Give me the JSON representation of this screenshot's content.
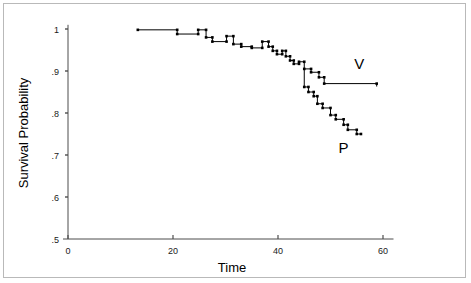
{
  "chart_data": {
    "type": "line",
    "subtype": "kaplan-meier-step",
    "title": "",
    "xlabel": "Time",
    "ylabel": "Survival Probability",
    "xlim": [
      0,
      62
    ],
    "ylim": [
      0.5,
      1.01
    ],
    "xticks": [
      0,
      20,
      40,
      60
    ],
    "xtick_labels": [
      "0",
      "20",
      "40",
      "60"
    ],
    "yticks": [
      0.5,
      0.6,
      0.7,
      0.8,
      0.9,
      1.0
    ],
    "ytick_labels": [
      ".5",
      ".6",
      ".7",
      ".8",
      ".9",
      "1"
    ],
    "grid": false,
    "legend": "inline-annotations",
    "annotations": [
      {
        "text": "V",
        "x": 55.5,
        "y": 0.905
      },
      {
        "text": "P",
        "x": 52.5,
        "y": 0.705
      }
    ],
    "series": [
      {
        "name": "V",
        "label": "V",
        "color": "#000000",
        "marker": "square",
        "points": [
          [
            13.3,
            0.998
          ],
          [
            20.8,
            0.998
          ],
          [
            20.8,
            0.988
          ],
          [
            24.8,
            0.988
          ],
          [
            24.8,
            0.998
          ],
          [
            26.3,
            0.998
          ],
          [
            26.3,
            0.98
          ],
          [
            27.5,
            0.98
          ],
          [
            27.5,
            0.97
          ],
          [
            30.2,
            0.97
          ],
          [
            30.2,
            0.983
          ],
          [
            31.5,
            0.983
          ],
          [
            31.5,
            0.964
          ],
          [
            33.0,
            0.964
          ],
          [
            33.0,
            0.958
          ],
          [
            35.0,
            0.958
          ],
          [
            35.0,
            0.955
          ],
          [
            37.0,
            0.955
          ],
          [
            37.0,
            0.97
          ],
          [
            38.2,
            0.97
          ],
          [
            38.2,
            0.958
          ],
          [
            39.0,
            0.958
          ],
          [
            39.0,
            0.948
          ],
          [
            39.8,
            0.948
          ],
          [
            39.8,
            0.94
          ],
          [
            40.8,
            0.94
          ],
          [
            40.8,
            0.948
          ],
          [
            41.5,
            0.948
          ],
          [
            41.5,
            0.935
          ],
          [
            42.3,
            0.935
          ],
          [
            42.3,
            0.925
          ],
          [
            43.0,
            0.925
          ],
          [
            43.0,
            0.917
          ],
          [
            44.0,
            0.917
          ],
          [
            44.0,
            0.922
          ],
          [
            45.0,
            0.922
          ],
          [
            45.0,
            0.905
          ],
          [
            46.3,
            0.905
          ],
          [
            46.3,
            0.897
          ],
          [
            47.8,
            0.897
          ],
          [
            47.8,
            0.885
          ],
          [
            48.8,
            0.885
          ],
          [
            48.8,
            0.87
          ],
          [
            58.8,
            0.87
          ],
          [
            58.8,
            0.863
          ]
        ]
      },
      {
        "name": "P",
        "label": "P",
        "color": "#000000",
        "marker": "square",
        "points": [
          [
            45.0,
            0.905
          ],
          [
            45.0,
            0.862
          ],
          [
            45.8,
            0.862
          ],
          [
            45.8,
            0.85
          ],
          [
            46.8,
            0.85
          ],
          [
            46.8,
            0.84
          ],
          [
            47.5,
            0.84
          ],
          [
            47.5,
            0.822
          ],
          [
            48.5,
            0.822
          ],
          [
            48.5,
            0.812
          ],
          [
            50.0,
            0.812
          ],
          [
            50.0,
            0.795
          ],
          [
            51.0,
            0.795
          ],
          [
            51.0,
            0.785
          ],
          [
            52.5,
            0.785
          ],
          [
            52.5,
            0.772
          ],
          [
            53.3,
            0.772
          ],
          [
            53.3,
            0.76
          ],
          [
            55.0,
            0.76
          ],
          [
            55.0,
            0.75
          ],
          [
            55.8,
            0.75
          ]
        ]
      }
    ]
  }
}
